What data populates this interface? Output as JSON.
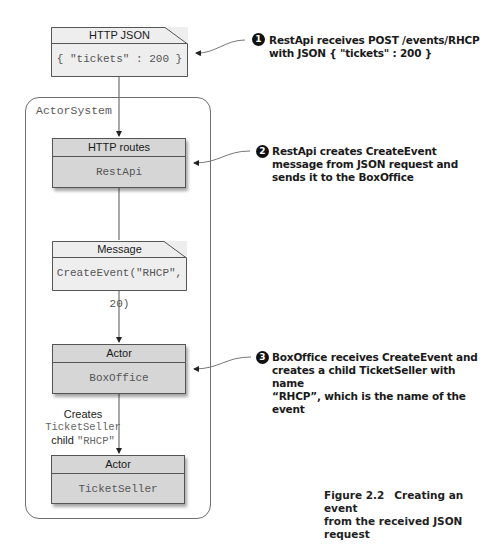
{
  "diagram": {
    "system": {
      "label": "ActorSystem"
    },
    "nodes": [
      {
        "id": "http-json",
        "kind": "note",
        "header": "HTTP JSON",
        "body": "{ \"tickets\" : 200 }"
      },
      {
        "id": "http-routes",
        "kind": "component",
        "header": "HTTP routes",
        "body": "RestApi"
      },
      {
        "id": "message",
        "kind": "note",
        "header": "Message",
        "body": "CreateEvent(\"RHCP\", 20)"
      },
      {
        "id": "box-office",
        "kind": "component",
        "header": "Actor",
        "body": "BoxOffice"
      },
      {
        "id": "ticket-seller",
        "kind": "component",
        "header": "Actor",
        "body": "TicketSeller"
      }
    ],
    "edges": [
      {
        "from": "http-json",
        "to": "http-routes"
      },
      {
        "from": "http-routes",
        "to": "message"
      },
      {
        "from": "message",
        "to": "box-office"
      },
      {
        "from": "box-office",
        "to": "ticket-seller",
        "label": {
          "line1": "Creates",
          "line2": "TicketSeller",
          "line3_prefix": "child ",
          "line3_code": "\"RHCP\""
        }
      }
    ],
    "callouts": [
      {
        "number": "1",
        "lines": [
          "RestApi receives POST /events/RHCP",
          "with JSON { \"tickets\" : 200 }"
        ]
      },
      {
        "number": "2",
        "lines": [
          "RestApi creates CreateEvent",
          "message from JSON request and",
          "sends it to the BoxOffice"
        ]
      },
      {
        "number": "3",
        "lines": [
          "BoxOffice receives CreateEvent and",
          "creates a child TicketSeller with name",
          "“RHCP”, which is the name of the event"
        ]
      }
    ],
    "caption": {
      "number": "Figure 2.2",
      "lines": [
        "Creating an event",
        "from the received JSON request"
      ]
    }
  }
}
